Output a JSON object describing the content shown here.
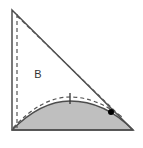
{
  "figure": {
    "background_color": "#ffffff",
    "width": 143,
    "height": 148,
    "labels": {
      "region_b": "B"
    },
    "colors": {
      "shaded_fill": "#bfbfbf",
      "outline_stroke": "#4d4d4d",
      "dashed_stroke": "#555555",
      "point_marker": "#000000",
      "tick_mark": "#333333",
      "label_color": "#333333"
    },
    "geometry": {
      "triangle": {
        "name": "right-triangle",
        "apex_top": [
          12,
          10
        ],
        "vertex_bottom_left": [
          12,
          130
        ],
        "vertex_bottom_right": [
          133,
          130
        ],
        "right_angle_at": "bottom-right"
      },
      "shaded_segment": {
        "name": "shaded-arc-region",
        "baseline_start": [
          12,
          130
        ],
        "baseline_end": [
          133,
          130
        ],
        "arc_peak": [
          70,
          101
        ],
        "fill": "#bfbfbf"
      },
      "dashed_arc": {
        "name": "dashed-arc",
        "start": [
          13,
          128
        ],
        "peak": [
          70,
          97
        ],
        "end": [
          122,
          117
        ]
      },
      "dashed_vertical": {
        "name": "dashed-vertical-line",
        "start": [
          17,
          14
        ],
        "end": [
          17,
          128
        ]
      },
      "dashed_hypotenuse": {
        "name": "dashed-hypotenuse-line",
        "start": [
          17,
          16
        ],
        "end": [
          119,
          115
        ]
      },
      "point_marker": {
        "name": "point-marker",
        "position": [
          111,
          112
        ],
        "radius": 3
      },
      "tick_mark": {
        "name": "tick-mark",
        "x": 70,
        "y_top": 93,
        "y_bottom": 104
      },
      "label_b_position": [
        38,
        74
      ]
    }
  }
}
